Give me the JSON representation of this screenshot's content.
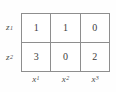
{
  "figure": {
    "type": "matrix-table",
    "colors": {
      "background": "#fefefe",
      "grid_line": "#8e8e8e",
      "value_text": "#3c3c3c",
      "label_text": "#4a4a4a"
    }
  },
  "row_labels": [
    {
      "base": "z",
      "sub": "1"
    },
    {
      "base": "z",
      "sub": "2"
    }
  ],
  "col_labels": [
    {
      "base": "x",
      "sub": "1"
    },
    {
      "base": "x",
      "sub": "2"
    },
    {
      "base": "x",
      "sub": "3"
    }
  ],
  "matrix": {
    "rows": [
      {
        "label": "z1",
        "cells": [
          "1",
          "1",
          "0"
        ]
      },
      {
        "label": "z2",
        "cells": [
          "3",
          "0",
          "2"
        ]
      }
    ]
  }
}
